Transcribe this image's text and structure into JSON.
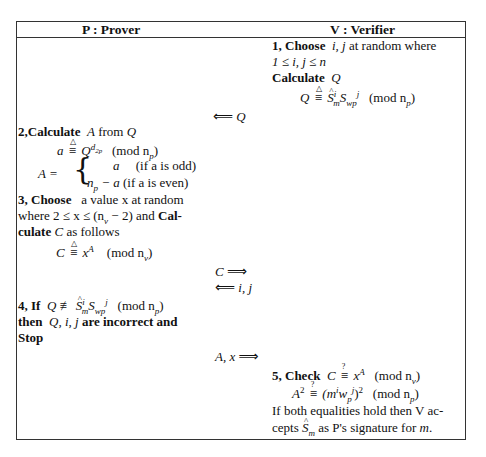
{
  "table": {
    "headers": {
      "prover": "P : Prover",
      "verifier": "V : Verifier"
    }
  },
  "verifier_step1": {
    "line1_bold": "1, Choose",
    "line1_vars": "i, j",
    "line1_rest": "at random where",
    "line2": "1 ≤ i, j ≤ n",
    "line3_bold": "Calculate",
    "line3_var": "Q",
    "line4_lhs": "Q",
    "line4_rel_top": "△",
    "line4_rel": "≡",
    "line4_S": "S",
    "line4_S_sub": "m",
    "line4_S_sup": "i",
    "line4_S2": "S",
    "line4_S2_sub": "wp",
    "line4_S2_sup": "j",
    "line4_mod": "(mod n",
    "line4_mod_sub": "p",
    "line4_close": ")"
  },
  "messages": {
    "msg1_arrow": "⟸",
    "msg1_label": "Q",
    "msg2_label": "C",
    "msg2_arrow": "⟹",
    "msg3_arrow": "⟸",
    "msg3_label": "i, j",
    "msg4_label": "A, x",
    "msg4_arrow": "⟹"
  },
  "prover_step2": {
    "title_bold": "2,Calculate",
    "title_var": "A",
    "title_mid": "from",
    "title_var2": "Q",
    "eq_lhs": "a",
    "eq_rel_top": "△",
    "eq_rel": "≡",
    "eq_base": "Q",
    "eq_exp": "d",
    "eq_exp_sub": "2p",
    "eq_mod": "(mod n",
    "eq_mod_sub": "p",
    "eq_close": ")",
    "case_lhs": "A =",
    "case1_val": "a",
    "case1_cond": "(if a is odd)",
    "case2_val": "n",
    "case2_val_sub": "p",
    "case2_val_rest": " − a",
    "case2_cond": "(if a is even)"
  },
  "prover_step3": {
    "line1_bold": "3, Choose",
    "line1_rest": "a value x at random",
    "line2_text": "where 2 ≤ x ≤ (n",
    "line2_sub": "v",
    "line2_rest": " − 2) and",
    "line2_bold": "Cal-",
    "line3_bold": "culate",
    "line3_var": "C",
    "line3_rest": "as follows",
    "eq_lhs": "C",
    "eq_rel_top": "△",
    "eq_rel": "≡",
    "eq_base": "x",
    "eq_exp": "A",
    "eq_mod": "(mod n",
    "eq_mod_sub": "v",
    "eq_close": ")"
  },
  "prover_step4": {
    "line1_bold": "4, If",
    "line1_lhs": "Q",
    "line1_rel": "≢",
    "line1_S": "S",
    "line1_S_sub": "m",
    "line1_S_sup": "i",
    "line1_S2": "S",
    "line1_S2_sub": "wp",
    "line1_S2_sup": "j",
    "line1_mod": "(mod n",
    "line1_mod_sub": "p",
    "line1_close": ")",
    "line2_bold1": "then",
    "line2_vars": "Q, i, j",
    "line2_bold2": "are incorrect and",
    "line3_bold": "Stop"
  },
  "verifier_step5": {
    "line1_bold": "5, Check",
    "line1_lhs": "C",
    "line1_rel_top": "?",
    "line1_rel": "≡",
    "line1_base": "x",
    "line1_exp": "A",
    "line1_mod": "(mod n",
    "line1_mod_sub": "v",
    "line1_close": ")",
    "line2_lhs": "A",
    "line2_lhs_exp": "2",
    "line2_rel_top": "?",
    "line2_rel": "≡",
    "line2_rhs": "(m",
    "line2_rhs_sup1": "i",
    "line2_rhs_w": "w",
    "line2_rhs_w_sub": "p",
    "line2_rhs_w_sup": "j",
    "line2_rhs_close": ")",
    "line2_rhs_exp": "2",
    "line2_mod": "(mod n",
    "line2_mod_sub": "p",
    "line2_close": ")",
    "line3": "If both equalities hold then V ac-",
    "line4_pre": "cepts",
    "line4_S": "S",
    "line4_S_sub": "m",
    "line4_mid": "as P's signature for",
    "line4_var": "m",
    "line4_end": "."
  }
}
